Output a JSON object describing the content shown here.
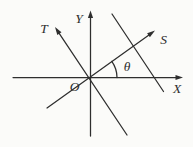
{
  "figure": {
    "background_color": "#fbfbf9",
    "line_color": "#2e2e2e",
    "labels": {
      "y_axis": "Y",
      "t_ray": "T",
      "s_ray": "S",
      "origin": "O",
      "x_axis": "X",
      "angle": "θ"
    }
  }
}
